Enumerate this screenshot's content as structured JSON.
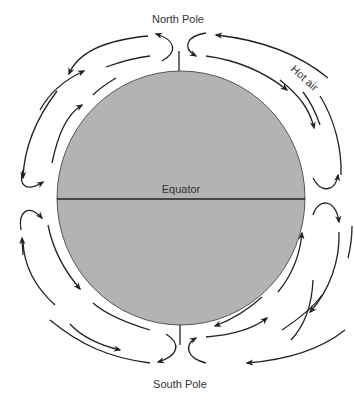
{
  "diagram": {
    "labels": {
      "north_pole": "North Pole",
      "south_pole": "South Pole",
      "equator": "Equator",
      "hot_air": "Hot air"
    },
    "colors": {
      "earth_fill": "#b3b3b3",
      "line": "#222222",
      "text": "#333333"
    }
  }
}
